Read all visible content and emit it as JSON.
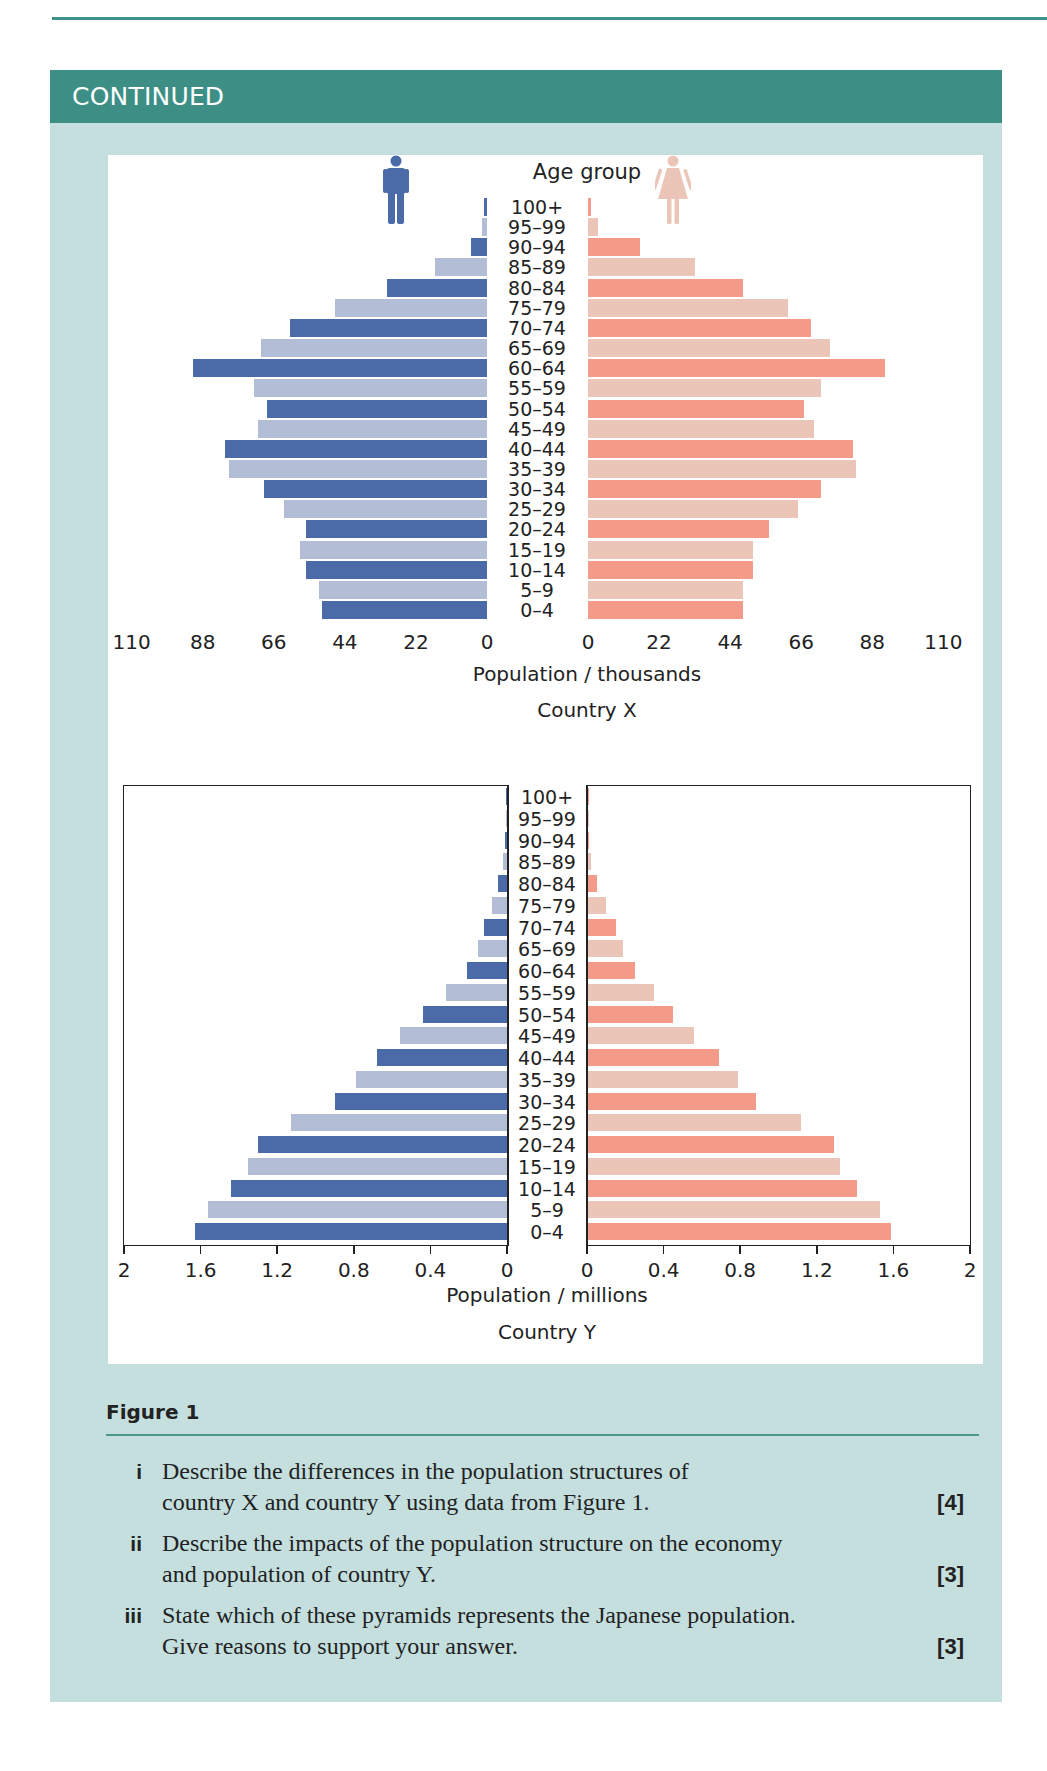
{
  "header": {
    "title": "CONTINUED"
  },
  "colors": {
    "male_dark": "#4a6aa8",
    "male_light": "#b3bdd6",
    "female_dark": "#f39a88",
    "female_light": "#ecc5b9",
    "teal": "#3d8f86",
    "card_bg": "#c5dfdf"
  },
  "icons": {
    "male": "male-figure-icon",
    "female": "female-figure-icon"
  },
  "figure": {
    "label": "Figure 1"
  },
  "questions": [
    {
      "num": "i",
      "lines": [
        "Describe the differences in the population structures of",
        "country X and country Y using data from Figure 1."
      ],
      "marks": "[4]"
    },
    {
      "num": "ii",
      "lines": [
        "Describe the impacts of the population structure on the economy",
        "and population of country Y."
      ],
      "marks": "[3]"
    },
    {
      "num": "iii",
      "lines": [
        "State which of these pyramids represents the Japanese population.",
        "Give reasons to support your answer."
      ],
      "marks": "[3]"
    }
  ],
  "chart_data": [
    {
      "type": "bar",
      "subtype": "population-pyramid",
      "title": "Country X",
      "age_label": "Age group",
      "xlabel": "Population / thousands",
      "ylabel": "Age group",
      "xlim": [
        0,
        110
      ],
      "ticks_left": [
        "110",
        "88",
        "66",
        "44",
        "22",
        "0"
      ],
      "ticks_right": [
        "0",
        "22",
        "44",
        "66",
        "88",
        "110"
      ],
      "categories": [
        "100+",
        "95–99",
        "90–94",
        "85–89",
        "80–84",
        "75–79",
        "70–74",
        "65–69",
        "60–64",
        "55–59",
        "50–54",
        "45–49",
        "40–44",
        "35–39",
        "30–34",
        "25–29",
        "20–24",
        "15–19",
        "10–14",
        "5–9",
        "0–4"
      ],
      "series": [
        {
          "name": "Male",
          "values": [
            1,
            1.5,
            5,
            16,
            31,
            47,
            61,
            70,
            91,
            72,
            68,
            71,
            81,
            80,
            69,
            63,
            56,
            58,
            56,
            52,
            51
          ]
        },
        {
          "name": "Female",
          "values": [
            1,
            3,
            16,
            33,
            48,
            62,
            69,
            75,
            92,
            72,
            67,
            70,
            82,
            83,
            72,
            65,
            56,
            51,
            51,
            48,
            48
          ]
        }
      ],
      "grid": false,
      "legend": "icons: male (left), female (right)"
    },
    {
      "type": "bar",
      "subtype": "population-pyramid",
      "title": "Country Y",
      "xlabel": "Population / millions",
      "ylabel": "Age group",
      "xlim": [
        0,
        2
      ],
      "ticks_left": [
        "2",
        "1.6",
        "1.2",
        "0.8",
        "0.4",
        "0"
      ],
      "ticks_right": [
        "0",
        "0.4",
        "0.8",
        "1.2",
        "1.6",
        "2"
      ],
      "categories": [
        "100+",
        "95–99",
        "90–94",
        "85–89",
        "80–84",
        "75–79",
        "70–74",
        "65–69",
        "60–64",
        "55–59",
        "50–54",
        "45–49",
        "40–44",
        "35–39",
        "30–34",
        "25–29",
        "20–24",
        "15–19",
        "10–14",
        "5–9",
        "0–4"
      ],
      "series": [
        {
          "name": "Male",
          "values": [
            0.005,
            0.005,
            0.01,
            0.02,
            0.045,
            0.08,
            0.12,
            0.15,
            0.21,
            0.32,
            0.44,
            0.56,
            0.68,
            0.79,
            0.9,
            1.13,
            1.3,
            1.35,
            1.44,
            1.56,
            1.63
          ]
        },
        {
          "name": "Female",
          "values": [
            0.003,
            0.005,
            0.01,
            0.02,
            0.05,
            0.1,
            0.15,
            0.19,
            0.25,
            0.35,
            0.45,
            0.56,
            0.69,
            0.79,
            0.88,
            1.12,
            1.29,
            1.32,
            1.41,
            1.53,
            1.59
          ]
        }
      ],
      "grid": false
    }
  ]
}
